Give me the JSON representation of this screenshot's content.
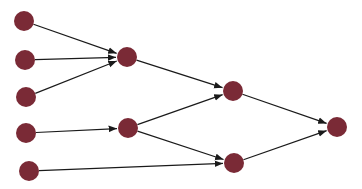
{
  "diagram": {
    "type": "directed-graph",
    "width": 362,
    "height": 189,
    "background": "#ffffff",
    "node_color": "#7a2a36",
    "edge_color": "#1a1a1a",
    "node_radius": 10,
    "nodes": [
      {
        "id": "n1",
        "x": 24,
        "y": 21
      },
      {
        "id": "n2",
        "x": 25,
        "y": 60
      },
      {
        "id": "n3",
        "x": 26,
        "y": 97
      },
      {
        "id": "n4",
        "x": 26,
        "y": 133
      },
      {
        "id": "n5",
        "x": 29,
        "y": 171
      },
      {
        "id": "n6",
        "x": 127,
        "y": 57
      },
      {
        "id": "n7",
        "x": 128,
        "y": 128
      },
      {
        "id": "n8",
        "x": 233,
        "y": 91
      },
      {
        "id": "n9",
        "x": 234,
        "y": 163
      },
      {
        "id": "n10",
        "x": 337,
        "y": 127
      }
    ],
    "edges": [
      {
        "from": "n1",
        "to": "n6"
      },
      {
        "from": "n2",
        "to": "n6"
      },
      {
        "from": "n3",
        "to": "n6"
      },
      {
        "from": "n4",
        "to": "n7"
      },
      {
        "from": "n5",
        "to": "n9"
      },
      {
        "from": "n6",
        "to": "n8"
      },
      {
        "from": "n7",
        "to": "n8"
      },
      {
        "from": "n7",
        "to": "n9"
      },
      {
        "from": "n8",
        "to": "n10"
      },
      {
        "from": "n9",
        "to": "n10"
      }
    ]
  }
}
